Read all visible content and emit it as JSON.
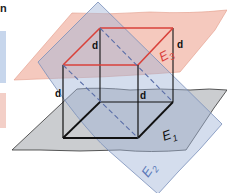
{
  "header_fragment": "n",
  "legend_swatches": [
    {
      "name": "blue-swatch",
      "color": "#c7d6ec"
    },
    {
      "name": "red-swatch",
      "color": "#f3cfc7"
    }
  ],
  "planes": {
    "E1": {
      "label": "E",
      "subscript": "1",
      "fill": "#b9bcc0",
      "stroke": "#333333"
    },
    "E2": {
      "label": "E",
      "subscript": "2",
      "fill": "#aebfdc",
      "stroke": "#7a8fba"
    },
    "E3": {
      "label": "E",
      "subscript": "3",
      "fill": "#f1b7a8",
      "stroke": "#d9806a"
    }
  },
  "distance_labels": [
    "d",
    "d",
    "d",
    "d"
  ],
  "colors": {
    "cube_edge": "#111111",
    "top_face_edge": "#d9413a",
    "dashed_intersection": "#5a6ea8"
  }
}
